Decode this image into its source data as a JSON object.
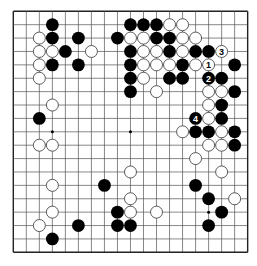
{
  "board": {
    "size": 19,
    "origin": {
      "x": 13.3,
      "y": 11.3
    },
    "spacing": {
      "x": 13.02,
      "y": 13.39
    },
    "stone_radius": 6.4,
    "colors": {
      "background": "#ffffff",
      "line": "#555555",
      "border": "#222222",
      "black": "#000000",
      "white": "#ffffff",
      "white_outline": "#333333"
    },
    "star_points": [
      [
        3,
        3
      ],
      [
        9,
        3
      ],
      [
        15,
        3
      ],
      [
        3,
        9
      ],
      [
        9,
        9
      ],
      [
        15,
        9
      ],
      [
        3,
        15
      ],
      [
        9,
        15
      ],
      [
        15,
        15
      ]
    ],
    "black": [
      [
        3,
        1
      ],
      [
        3,
        2
      ],
      [
        5,
        2
      ],
      [
        4,
        3
      ],
      [
        3,
        4
      ],
      [
        5,
        4
      ],
      [
        9,
        1
      ],
      [
        10,
        1
      ],
      [
        11,
        1
      ],
      [
        8,
        2
      ],
      [
        11,
        2
      ],
      [
        12,
        2
      ],
      [
        9,
        3
      ],
      [
        12,
        3
      ],
      [
        14,
        3
      ],
      [
        15,
        3
      ],
      [
        9,
        4
      ],
      [
        13,
        4
      ],
      [
        17,
        4
      ],
      [
        9,
        5
      ],
      [
        12,
        5
      ],
      [
        13,
        5
      ],
      [
        16,
        5
      ],
      [
        9,
        6
      ],
      [
        17,
        6
      ],
      [
        16,
        7
      ],
      [
        16,
        8
      ],
      [
        14,
        9
      ],
      [
        15,
        9
      ],
      [
        17,
        9
      ],
      [
        17,
        10
      ],
      [
        2,
        8
      ],
      [
        7,
        13
      ],
      [
        5,
        16
      ],
      [
        3,
        17
      ],
      [
        8,
        15
      ],
      [
        8,
        16
      ],
      [
        9,
        16
      ],
      [
        14,
        13
      ],
      [
        15,
        14
      ],
      [
        16,
        15
      ],
      [
        15,
        16
      ]
    ],
    "white": [
      [
        2,
        2
      ],
      [
        2,
        3
      ],
      [
        3,
        3
      ],
      [
        6,
        3
      ],
      [
        2,
        4
      ],
      [
        2,
        5
      ],
      [
        3,
        7
      ],
      [
        2,
        10
      ],
      [
        3,
        10
      ],
      [
        3,
        13
      ],
      [
        3,
        15
      ],
      [
        2,
        16
      ],
      [
        12,
        1
      ],
      [
        13,
        1
      ],
      [
        9,
        2
      ],
      [
        10,
        2
      ],
      [
        13,
        2
      ],
      [
        14,
        2
      ],
      [
        10,
        3
      ],
      [
        11,
        3
      ],
      [
        13,
        3
      ],
      [
        10,
        4
      ],
      [
        11,
        4
      ],
      [
        12,
        4
      ],
      [
        14,
        4
      ],
      [
        10,
        5
      ],
      [
        11,
        6
      ],
      [
        15,
        6
      ],
      [
        16,
        6
      ],
      [
        15,
        7
      ],
      [
        15,
        8
      ],
      [
        13,
        9
      ],
      [
        16,
        9
      ],
      [
        15,
        10
      ],
      [
        16,
        10
      ],
      [
        14,
        11
      ],
      [
        16,
        12
      ],
      [
        9,
        12
      ],
      [
        9,
        14
      ],
      [
        9,
        15
      ],
      [
        11,
        15
      ],
      [
        17,
        14
      ]
    ],
    "numbered_moves": [
      {
        "label": "1",
        "color": "white",
        "pos": [
          15,
          4
        ]
      },
      {
        "label": "2",
        "color": "black",
        "pos": [
          15,
          5
        ]
      },
      {
        "label": "3",
        "color": "white",
        "pos": [
          16,
          3
        ]
      },
      {
        "label": "4",
        "color": "black",
        "pos": [
          14,
          8
        ]
      }
    ]
  }
}
